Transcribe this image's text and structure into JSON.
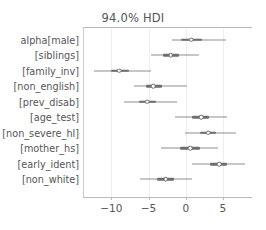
{
  "chart_data": {
    "type": "scatter",
    "subtype": "forest-plot",
    "title": "94.0% HDI",
    "xlabel": "",
    "ylabel": "",
    "xlim": [
      -13.8,
      8.9
    ],
    "xticks": [
      -10,
      -5,
      0,
      5
    ],
    "xticklabels": [
      "−10",
      "−5",
      "0",
      "5"
    ],
    "grid": true,
    "grid_axis": "x",
    "legend": "none",
    "categories": [
      "alpha[male]",
      "[siblings]",
      "[family_inv]",
      "[non_english]",
      "[prev_disab]",
      "[age_test]",
      "[non_severe_hl]",
      "[mother_hs]",
      "[early_ident]",
      "[non_white]"
    ],
    "series": [
      {
        "name": "94.0% HDI",
        "points": [
          {
            "label": "alpha[male]",
            "value": 0.7,
            "hdi_low": -1.9,
            "hdi_high": 5.4,
            "iqr_low": -0.6,
            "iqr_high": 2.2
          },
          {
            "label": "[siblings]",
            "value": -2.0,
            "hdi_low": -4.7,
            "hdi_high": 1.8,
            "iqr_low": -3.0,
            "iqr_high": -0.9
          },
          {
            "label": "[family_inv]",
            "value": -8.9,
            "hdi_low": -12.3,
            "hdi_high": -4.6,
            "iqr_low": -10.1,
            "iqr_high": -7.6
          },
          {
            "label": "[non_english]",
            "value": -4.4,
            "hdi_low": -6.9,
            "hdi_high": 0.2,
            "iqr_low": -5.4,
            "iqr_high": -3.2
          },
          {
            "label": "[prev_disab]",
            "value": -5.2,
            "hdi_low": -8.3,
            "hdi_high": -1.2,
            "iqr_low": -6.3,
            "iqr_high": -4.0
          },
          {
            "label": "[age_test]",
            "value": 2.1,
            "hdi_low": -1.5,
            "hdi_high": 5.5,
            "iqr_low": 0.9,
            "iqr_high": 3.1
          },
          {
            "label": "[non_severe_hl]",
            "value": 3.0,
            "hdi_low": -0.1,
            "hdi_high": 6.8,
            "iqr_low": 1.9,
            "iqr_high": 4.1
          },
          {
            "label": "[mother_hs]",
            "value": 0.6,
            "hdi_low": -3.3,
            "hdi_high": 4.3,
            "iqr_low": -0.8,
            "iqr_high": 1.9
          },
          {
            "label": "[early_ident]",
            "value": 4.5,
            "hdi_low": 0.9,
            "hdi_high": 8.0,
            "iqr_low": 3.3,
            "iqr_high": 5.6
          },
          {
            "label": "[non_white]",
            "value": -2.7,
            "hdi_low": -6.2,
            "hdi_high": 0.8,
            "iqr_low": -3.8,
            "iqr_high": -1.6
          }
        ]
      }
    ],
    "colors": {
      "line": "#8d8d8d",
      "inner_line": "#6e6e6e",
      "marker_face": "#ffffff",
      "marker_edge": "#6e6e6e",
      "grid": "#ededed",
      "spine": "#b9b9b9",
      "text": "#555555"
    }
  }
}
